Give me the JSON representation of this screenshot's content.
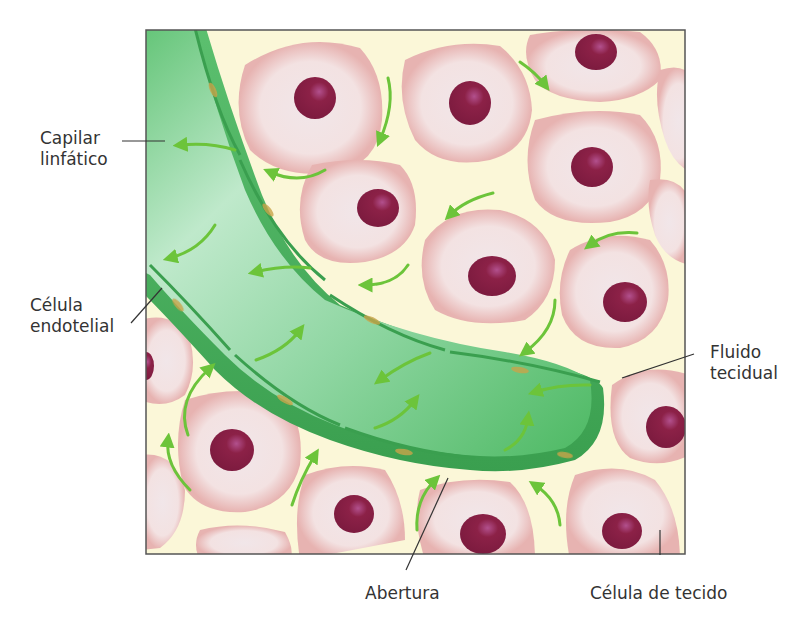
{
  "figure": {
    "colors": {
      "background": "#ffffff",
      "interstitial_fluid": "#fbf7d8",
      "frame_border": "#555555",
      "capillary_light": "#b9e6c6",
      "capillary_mid": "#5cc470",
      "capillary_dark": "#3aa14f",
      "cell_fill": "#f3e3e3",
      "cell_rim": "#e8b4b2",
      "nucleus": "#8a1f45",
      "nucleus_highlight": "#b04a8a",
      "arrow": "#6cc43a",
      "endothelial_nucleus": "#c9a44a",
      "leader_line": "#333333",
      "label_text": "#333333"
    }
  },
  "labels": {
    "capilar_linfatico": {
      "line1": "Capilar",
      "line2": "linfático"
    },
    "celula_endotelial": {
      "line1": "Célula",
      "line2": "endotelial"
    },
    "fluido_tecidual": {
      "line1": "Fluido",
      "line2": "tecidual"
    },
    "abertura": {
      "line1": "Abertura"
    },
    "celula_de_tecido": {
      "line1": "Célula de tecido"
    }
  }
}
